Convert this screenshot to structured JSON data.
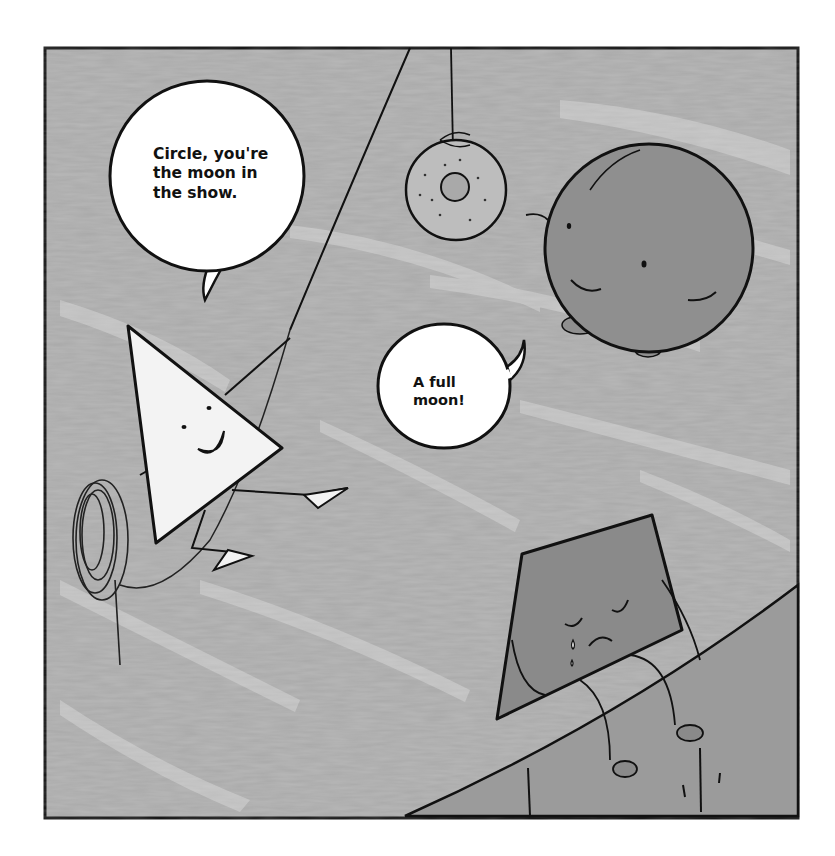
{
  "illustration": {
    "description": "Grayscale comic panel: a smiling triangle swinging on a rope speaks to a round circle character near a hanging donut; a sad trapezoid/quadrilateral sits crying on a curved ledge.",
    "colors": {
      "page_background": "#ffffff",
      "panel_background": "#a8a8a8",
      "panel_streaks": "#c8c8c8",
      "ink": "#111111",
      "bubble_fill": "#ffffff",
      "triangle_fill": "#f4f4f4",
      "circle_fill": "#8f8f8f",
      "quad_fill": "#8a8a8a",
      "ledge_fill": "#9a9a9a",
      "donut_fill": "#b8b8b8"
    },
    "speech_bubbles": [
      {
        "speaker": "triangle",
        "lines": [
          "Circle, you're",
          "the moon in",
          "the show."
        ]
      },
      {
        "speaker": "circle",
        "lines": [
          "A full",
          "moon!"
        ]
      }
    ],
    "characters": [
      "triangle",
      "circle",
      "quadrilateral",
      "donut"
    ]
  }
}
